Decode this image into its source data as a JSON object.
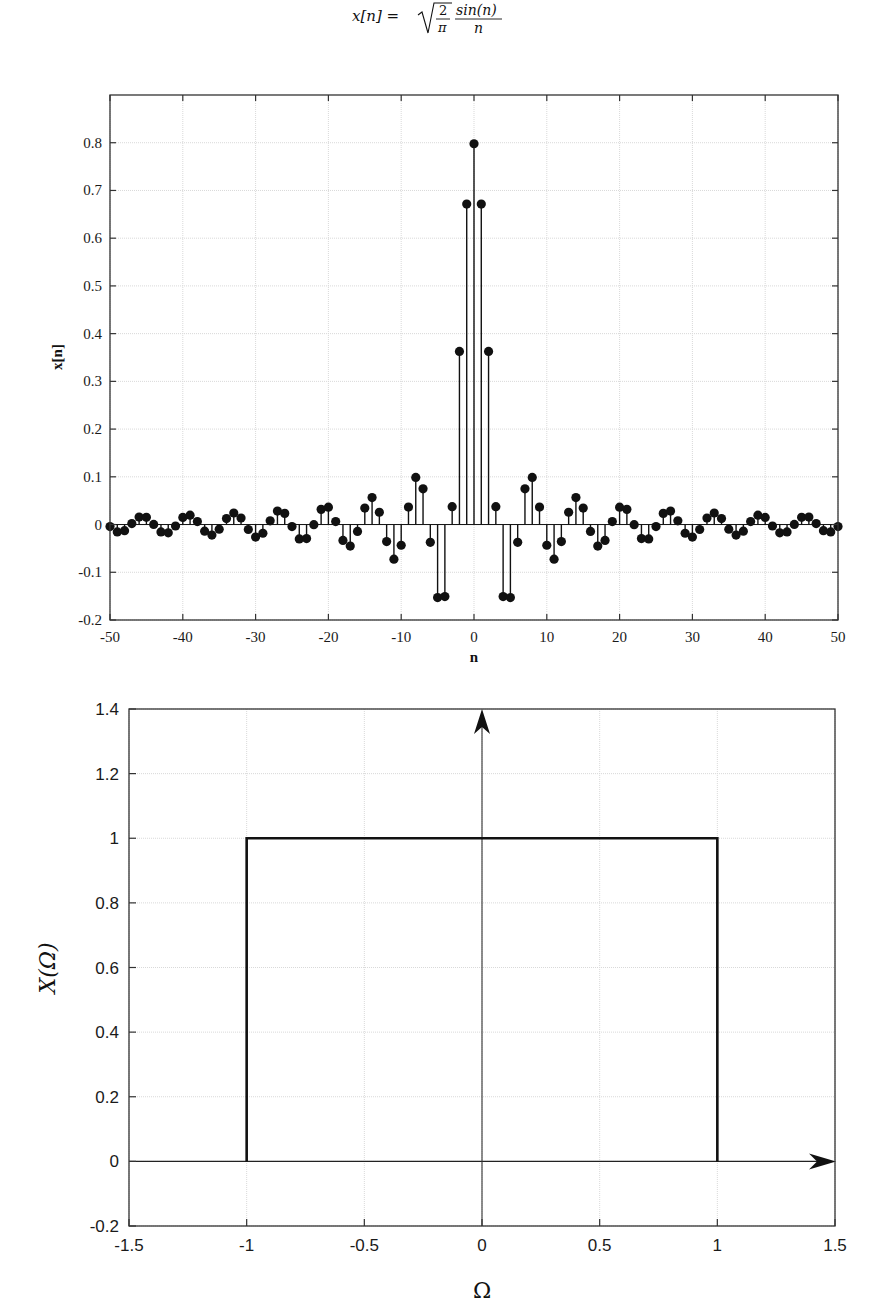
{
  "chart_data": [
    {
      "type": "stem",
      "title": "x[n] = sqrt(2/π) · sin(n)/n",
      "title_parts": {
        "lhs": "x[n] =",
        "num": "2",
        "den": "π",
        "frac_num": "sin(n)",
        "frac_den": "n"
      },
      "xlabel": "n",
      "ylabel": "x[n]",
      "xlim": [
        -50,
        50
      ],
      "ylim": [
        -0.2,
        0.9
      ],
      "xticks": [
        -50,
        -40,
        -30,
        -20,
        -10,
        0,
        10,
        20,
        30,
        40,
        50
      ],
      "xtick_labels": [
        "-50",
        "-40",
        "-30",
        "-20",
        "-10",
        "0",
        "10",
        "20",
        "30",
        "40",
        "50"
      ],
      "yticks": [
        -0.2,
        -0.1,
        0,
        0.1,
        0.2,
        0.3,
        0.4,
        0.5,
        0.6,
        0.7,
        0.8
      ],
      "ytick_labels": [
        "-0.2",
        "-0.1",
        "0",
        "0.1",
        "0.2",
        "0.3",
        "0.4",
        "0.5",
        "0.6",
        "0.7",
        "0.8"
      ],
      "grid": true,
      "n_range": [
        -50,
        50
      ],
      "formula": "sqrt(2/pi)*sin(n)/n, x[0]=sqrt(2/pi)",
      "key_values": {
        "n=0": 0.798,
        "n=±1": 0.671,
        "n=±2": 0.363,
        "n=±3": 0.056,
        "n=±4": -0.151,
        "n=±5": -0.153,
        "n=±6": -0.037,
        "n=±7": 0.075,
        "n=±8": 0.099,
        "n=±9": 0.037,
        "n=±10": -0.043,
        "n=±11": -0.072
      }
    },
    {
      "type": "line",
      "title": "",
      "xlabel": "Ω",
      "ylabel": "X(Ω)",
      "xlim": [
        -1.5,
        1.5
      ],
      "ylim": [
        -0.2,
        1.4
      ],
      "xticks": [
        -1.5,
        -1,
        -0.5,
        0,
        0.5,
        1,
        1.5
      ],
      "xtick_labels": [
        "-1.5",
        "-1",
        "-0.5",
        "0",
        "0.5",
        "1",
        "1.5"
      ],
      "yticks": [
        -0.2,
        0,
        0.2,
        0.4,
        0.6,
        0.8,
        1,
        1.2,
        1.4
      ],
      "ytick_labels": [
        "-0.2",
        "0",
        "0.2",
        "0.4",
        "0.6",
        "0.8",
        "1",
        "1.2",
        "1.4"
      ],
      "grid": true,
      "series": [
        {
          "name": "X(Ω) rectangular pulse",
          "x": [
            -1,
            -1,
            1,
            1
          ],
          "y": [
            0,
            1,
            1,
            0
          ]
        }
      ],
      "annotations": [
        "arrow along Ω axis at y=0",
        "arrow along vertical axis at Ω=0"
      ]
    }
  ],
  "colors": {
    "line": "#111111",
    "grid": "#d9d9d9",
    "axes": "#333333",
    "background": "#ffffff"
  }
}
